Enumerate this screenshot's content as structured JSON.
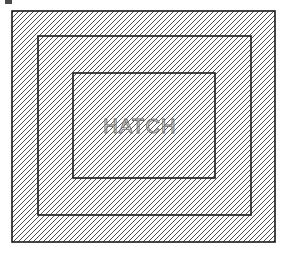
{
  "figure": {
    "background_color": "#ffffff",
    "line_color": "#1a1a1a",
    "hatch_color": "#3a3a3a",
    "text_color": "#6e6e6e"
  },
  "label": {
    "text": "HATCH",
    "x": 140,
    "y": 128,
    "font_size": 20
  },
  "hatch": {
    "pattern_name": "diagonal-45-forward",
    "angle_degrees": 45,
    "spacing_px": 5,
    "stroke_width_px": 0.9,
    "direction": "lower-left to upper-right"
  },
  "rectangles": [
    {
      "name": "outer-rectangle",
      "x": 12,
      "y": 11,
      "width": 263,
      "height": 231,
      "stroke_width": 1.6,
      "hatched": true
    },
    {
      "name": "middle-rectangle",
      "x": 38,
      "y": 36,
      "width": 213,
      "height": 179,
      "stroke_width": 1.6,
      "hatched": true
    },
    {
      "name": "inner-rectangle",
      "x": 73,
      "y": 73,
      "width": 142,
      "height": 105,
      "stroke_width": 1.6,
      "hatched": true
    }
  ],
  "artifact": {
    "name": "scan-speck",
    "x": 5,
    "y": 0,
    "width": 7,
    "height": 4,
    "color": "#4a4a4a"
  }
}
